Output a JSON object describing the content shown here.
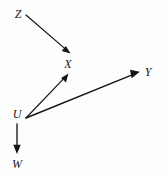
{
  "figure": {
    "type": "directed-graph",
    "background_color": "#fdfdfd",
    "ink_color": "#141414",
    "width": 166,
    "height": 178
  },
  "nodes": [
    {
      "id": "Z",
      "label": "Z",
      "x": 18,
      "y": 14
    },
    {
      "id": "X",
      "label": "X",
      "x": 68,
      "y": 64
    },
    {
      "id": "Y",
      "label": "Y",
      "x": 148,
      "y": 72
    },
    {
      "id": "U",
      "label": "U",
      "x": 17,
      "y": 114
    },
    {
      "id": "W",
      "label": "W",
      "x": 17,
      "y": 164
    }
  ],
  "edges": [
    {
      "id": "z-to-x",
      "from": "Z",
      "to": "X",
      "x1": 26,
      "y1": 15,
      "x2": 70,
      "y2": 53,
      "arrow": "to"
    },
    {
      "id": "u-to-x",
      "from": "U",
      "to": "X",
      "x1": 26,
      "y1": 118,
      "x2": 68,
      "y2": 74,
      "arrow": "to"
    },
    {
      "id": "u-to-y",
      "from": "U",
      "to": "Y",
      "x1": 26,
      "y1": 118,
      "x2": 139,
      "y2": 72,
      "arrow": "to"
    },
    {
      "id": "u-to-w",
      "from": "U",
      "to": "W",
      "x1": 17,
      "y1": 124,
      "x2": 17,
      "y2": 153,
      "arrow": "to"
    }
  ]
}
